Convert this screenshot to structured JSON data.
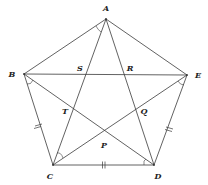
{
  "figure": {
    "type": "regular-pentagon-with-diagonals",
    "vertices": [
      {
        "name": "A",
        "x": 106,
        "y": 19,
        "label_x": 106,
        "label_y": 9
      },
      {
        "name": "B",
        "x": 24,
        "y": 74,
        "label_x": 12,
        "label_y": 75
      },
      {
        "name": "C",
        "x": 53,
        "y": 165,
        "label_x": 50,
        "label_y": 177
      },
      {
        "name": "D",
        "x": 154,
        "y": 165,
        "label_x": 158,
        "label_y": 177
      },
      {
        "name": "E",
        "x": 187,
        "y": 75,
        "label_x": 198,
        "label_y": 76
      }
    ],
    "intersections": [
      {
        "name": "S",
        "x": 84,
        "y": 74,
        "label_x": 80,
        "label_y": 69
      },
      {
        "name": "R",
        "x": 126,
        "y": 74,
        "label_x": 130,
        "label_y": 69
      },
      {
        "name": "T",
        "x": 73,
        "y": 112,
        "label_x": 65,
        "label_y": 112
      },
      {
        "name": "Q",
        "x": 137,
        "y": 112,
        "label_x": 144,
        "label_y": 112
      },
      {
        "name": "P",
        "x": 104,
        "y": 136,
        "label_x": 104,
        "label_y": 146
      }
    ],
    "sides": [
      {
        "from": "A",
        "to": "B"
      },
      {
        "from": "B",
        "to": "C",
        "ticks": 2
      },
      {
        "from": "C",
        "to": "D",
        "ticks": 2
      },
      {
        "from": "D",
        "to": "E",
        "ticks": 2
      },
      {
        "from": "E",
        "to": "A"
      }
    ],
    "diagonals": [
      {
        "from": "A",
        "to": "C"
      },
      {
        "from": "A",
        "to": "D"
      },
      {
        "from": "B",
        "to": "E"
      },
      {
        "from": "B",
        "to": "D"
      },
      {
        "from": "C",
        "to": "E"
      }
    ],
    "angle_marks": [
      {
        "vertex": "A",
        "between": [
          "B",
          "C"
        ]
      },
      {
        "vertex": "B",
        "between": [
          "C",
          "D"
        ]
      },
      {
        "vertex": "E",
        "between": [
          "D",
          "C"
        ]
      },
      {
        "vertex": "C",
        "between": [
          "A",
          "E"
        ]
      },
      {
        "vertex": "D",
        "between": [
          "C",
          "B"
        ]
      }
    ]
  },
  "labels": {
    "A": "A",
    "B": "B",
    "C": "C",
    "D": "D",
    "E": "E",
    "S": "S",
    "R": "R",
    "T": "T",
    "Q": "Q",
    "P": "P"
  }
}
